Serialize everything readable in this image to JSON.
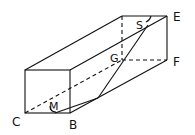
{
  "diagram": {
    "type": "rectangular prism (cuboid) geometry figure",
    "labels": {
      "C": "C",
      "B": "B",
      "M": "M",
      "G": "G",
      "S": "S",
      "E": "E",
      "F": "F"
    },
    "colors": {
      "stroke": "#111111",
      "background": "#ffffff"
    }
  }
}
